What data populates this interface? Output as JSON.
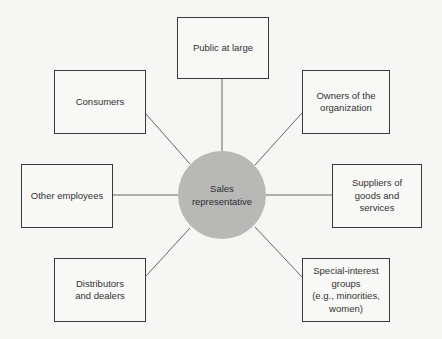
{
  "diagram": {
    "type": "hub-and-spoke",
    "center": {
      "label": "Sales\nrepresentative",
      "fill": "#b8b8b6"
    },
    "nodes": {
      "public": {
        "label": "Public at large"
      },
      "consumers": {
        "label": "Consumers"
      },
      "owners": {
        "label": "Owners of the\norganization"
      },
      "other": {
        "label": "Other employees"
      },
      "suppliers": {
        "label": "Suppliers of\ngoods and\nservices"
      },
      "distrib": {
        "label": "Distributors\nand dealers"
      },
      "special": {
        "label": "Special-interest\ngroups\n(e.g., minorities,\nwomen)"
      }
    },
    "edges": [
      [
        "center",
        "public"
      ],
      [
        "center",
        "consumers"
      ],
      [
        "center",
        "owners"
      ],
      [
        "center",
        "other"
      ],
      [
        "center",
        "suppliers"
      ],
      [
        "center",
        "distrib"
      ],
      [
        "center",
        "special"
      ]
    ]
  }
}
